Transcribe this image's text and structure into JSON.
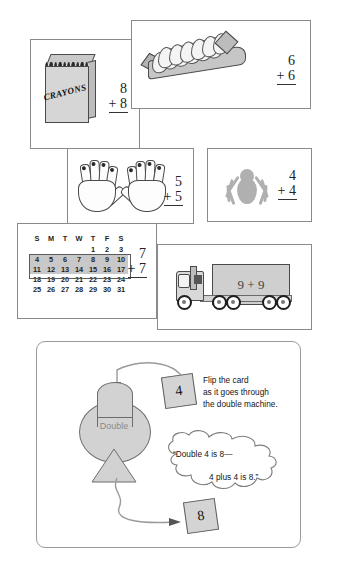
{
  "page": {
    "background": "#ffffff"
  },
  "colors": {
    "panel_border": "#8a8a8a",
    "machine_fill": "#d2d2d2",
    "card_fill": "#d4d4d4",
    "calendar_highlight": "#c8c8c8",
    "spider_fill": "#b0b0b0",
    "truck_fill": "#cfcfcf",
    "ink": "#1a1a1a"
  },
  "panels": [
    {
      "id": "crayons",
      "name": "crayon-box-panel",
      "image_label": "CRAYONS",
      "fact": {
        "addend1": "8",
        "addend2": "+ 8"
      }
    },
    {
      "id": "eggs",
      "name": "egg-carton-panel",
      "egg_count": 12,
      "fact": {
        "addend1": "6",
        "addend2": "+ 6"
      }
    },
    {
      "id": "hands",
      "name": "hands-panel",
      "fact": {
        "addend1": "5",
        "addend2": "+ 5"
      }
    },
    {
      "id": "spider",
      "name": "spider-panel",
      "fact": {
        "addend1": "4",
        "addend2": "+ 4"
      }
    },
    {
      "id": "calendar",
      "name": "calendar-panel",
      "fact": {
        "addend1": "7",
        "addend2": "+ 7"
      }
    },
    {
      "id": "truck",
      "name": "truck-panel",
      "trailer_text": "9 + 9"
    }
  ],
  "calendar": {
    "weekday_headers": [
      "S",
      "M",
      "T",
      "W",
      "T",
      "F",
      "S"
    ],
    "weeks": [
      [
        "",
        "",
        "",
        "",
        "1",
        "2",
        "3"
      ],
      [
        "4",
        "5",
        "6",
        "7",
        "8",
        "9",
        "10"
      ],
      [
        "11",
        "12",
        "13",
        "14",
        "15",
        "16",
        "17"
      ],
      [
        "18",
        "19",
        "20",
        "21",
        "22",
        "23",
        "24"
      ],
      [
        "25",
        "26",
        "27",
        "28",
        "29",
        "30",
        "31"
      ]
    ],
    "highlighted_weeks": [
      1,
      2
    ]
  },
  "double_machine": {
    "name": "double-machine",
    "machine_label": "Double",
    "input_card": "4",
    "output_card": "8",
    "instruction_lines": [
      "Flip the card",
      "as it goes through",
      "the double machine."
    ],
    "speech_line1": "“Double 4 is 8—",
    "speech_line2": "4 plus 4 is 8.”"
  }
}
